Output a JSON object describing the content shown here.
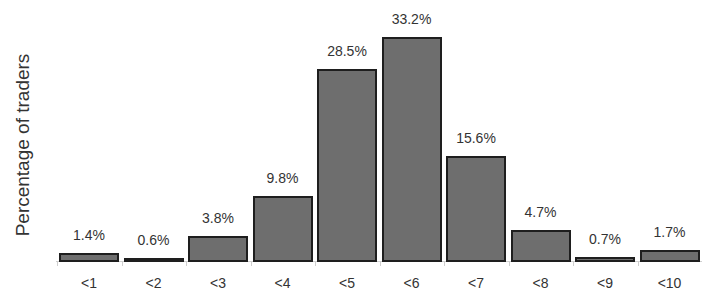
{
  "chart_data": {
    "type": "bar",
    "title": "",
    "xlabel": "",
    "ylabel": "Percentage of traders",
    "categories": [
      "<1",
      "<2",
      "<3",
      "<4",
      "<5",
      "<6",
      "<7",
      "<8",
      "<9",
      "<10"
    ],
    "values": [
      1.4,
      0.6,
      3.8,
      9.8,
      28.5,
      33.2,
      15.6,
      4.7,
      0.7,
      1.7
    ],
    "value_labels": [
      "1.4%",
      "0.6%",
      "3.8%",
      "9.8%",
      "28.5%",
      "33.2%",
      "15.6%",
      "4.7%",
      "0.7%",
      "1.7%"
    ],
    "ylim": [
      0,
      35
    ],
    "grid": false,
    "legend": null,
    "colors": {
      "bar_fill": "#6e6e6e",
      "bar_edge": "#1e1e1e"
    }
  }
}
